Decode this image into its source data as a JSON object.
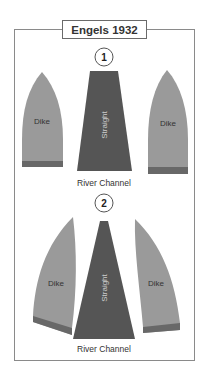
{
  "title": "Engels 1932",
  "colors": {
    "dike": "#9a9a9a",
    "dike_base": "#686868",
    "channel": "#555555",
    "frame": "#8a8a8a",
    "text": "#333333"
  },
  "panels": [
    {
      "number": "1",
      "left_dike_label": "Dike",
      "right_dike_label": "Dike",
      "channel_shape_label": "Straight",
      "channel_caption": "River Channel"
    },
    {
      "number": "2",
      "left_dike_label": "Dike",
      "right_dike_label": "Dike",
      "channel_shape_label": "Straight",
      "channel_caption": "River Channel"
    }
  ]
}
